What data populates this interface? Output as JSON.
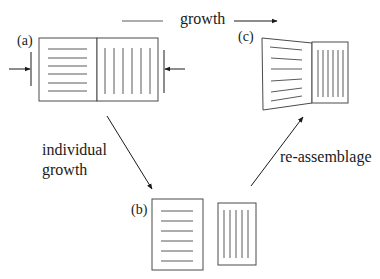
{
  "diagram": {
    "top_label": "growth",
    "panels": {
      "a": {
        "label": "(a)"
      },
      "b": {
        "label": "(b)"
      },
      "c": {
        "label": "(c)"
      }
    },
    "edges": {
      "a_to_b": {
        "label_line1": "individual",
        "label_line2": "growth"
      },
      "b_to_c": {
        "label": "re-assemblage"
      }
    },
    "colors": {
      "stroke": "#4a4a4a",
      "text": "#1a1a1a",
      "background": "#ffffff"
    }
  }
}
